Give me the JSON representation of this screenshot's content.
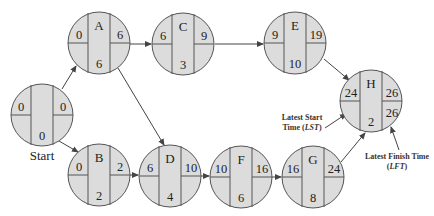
{
  "diagram": {
    "type": "network-diagram",
    "node_layout": {
      "center_top": "activity letter",
      "left_upper": "earliest start / latest start",
      "right_upper": "earliest finish / latest finish",
      "center_bottom": "duration"
    },
    "colors": {
      "node_fill": "#dcdcdc",
      "node_stroke": "#555555",
      "edge": "#444444",
      "text": "#222222"
    },
    "nodes": [
      {
        "id": "start",
        "letter": "",
        "left": "0",
        "right": "0",
        "bottom": "0",
        "label": "Start"
      },
      {
        "id": "A",
        "letter": "A",
        "left": "0",
        "right": "6",
        "bottom": "6"
      },
      {
        "id": "B",
        "letter": "B",
        "left": "0",
        "right": "2",
        "bottom": "2"
      },
      {
        "id": "C",
        "letter": "C",
        "left": "6",
        "right": "9",
        "bottom": "3"
      },
      {
        "id": "D",
        "letter": "D",
        "left": "6",
        "right": "10",
        "bottom": "4"
      },
      {
        "id": "E",
        "letter": "E",
        "left": "9",
        "right": "19",
        "bottom": "10"
      },
      {
        "id": "F",
        "letter": "F",
        "left": "10",
        "right": "16",
        "bottom": "6"
      },
      {
        "id": "G",
        "letter": "G",
        "left": "16",
        "right": "24",
        "bottom": "8"
      },
      {
        "id": "H",
        "letter": "H",
        "left": "24",
        "right": "26",
        "bottom": "2",
        "right_lower": "26"
      }
    ],
    "edges": [
      {
        "from": "start",
        "to": "A"
      },
      {
        "from": "start",
        "to": "B"
      },
      {
        "from": "A",
        "to": "C"
      },
      {
        "from": "A",
        "to": "D"
      },
      {
        "from": "B",
        "to": "D"
      },
      {
        "from": "C",
        "to": "E"
      },
      {
        "from": "D",
        "to": "F"
      },
      {
        "from": "F",
        "to": "G"
      },
      {
        "from": "E",
        "to": "H"
      },
      {
        "from": "G",
        "to": "H"
      }
    ],
    "annotations": {
      "lst_line1": "Latest Start",
      "lst_line2_prefix": "Time (",
      "lst_abbr": "LST",
      "lst_line2_suffix": ")",
      "lft_line1": "Latest Finish Time",
      "lft_line2_prefix": "(",
      "lft_abbr": "LFT",
      "lft_line2_suffix": ")"
    }
  }
}
